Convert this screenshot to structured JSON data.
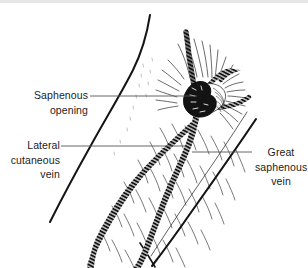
{
  "figure": {
    "background_color": "#ffffff",
    "ink_color": "#1b1b1b",
    "leader_color": "#555555"
  },
  "labels": {
    "saphenous_opening": "Saphenous\nopening",
    "lateral_cutaneous_vein": "Lateral\ncutaneous\nvein",
    "great_saphenous_vein": "Great\nsaphenous\nvein"
  },
  "structures": [
    {
      "name": "saphenous-opening",
      "kind": "fossa-ovalis"
    },
    {
      "name": "great-saphenous-vein",
      "kind": "vein"
    },
    {
      "name": "lateral-cutaneous-vein",
      "kind": "vein"
    },
    {
      "name": "tributary-vein-superior",
      "kind": "vein"
    },
    {
      "name": "tributary-vein-lateral",
      "kind": "vein"
    },
    {
      "name": "thigh-contour-medial",
      "kind": "outline"
    },
    {
      "name": "thigh-contour-lateral",
      "kind": "outline"
    },
    {
      "name": "fascia-lata-hatching",
      "kind": "texture"
    }
  ]
}
